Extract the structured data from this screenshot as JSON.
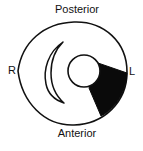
{
  "diagram": {
    "labels": {
      "top": "Posterior",
      "bottom": "Anterior",
      "left": "R",
      "right": "L"
    },
    "shapes": {
      "outer_outline": "egg-shaped outline (cross-section)",
      "crescent": "crescent shape on left side",
      "inner_circle": "small circle right of center",
      "shaded_wedge": "black wedge from circle to right outline"
    },
    "colors": {
      "stroke": "#111111",
      "fill_dark": "#0a0a0a",
      "background": "#ffffff"
    }
  }
}
